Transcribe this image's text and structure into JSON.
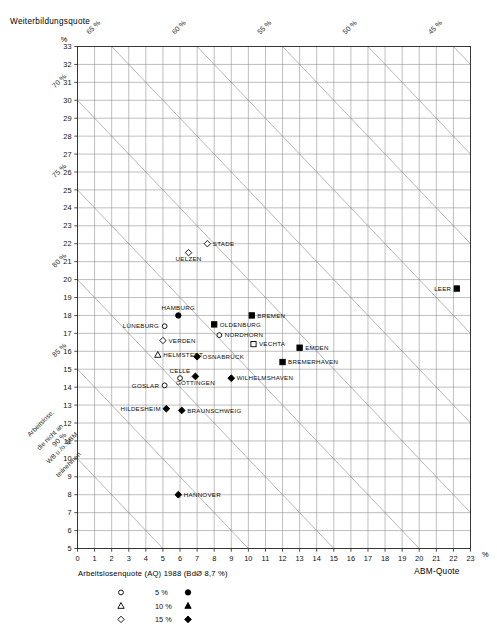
{
  "meta": {
    "y_axis_title": "Weiterbildungsquote",
    "y_axis_unit": "%",
    "x_axis_title": "ABM-Quote",
    "x_axis_unit": "%",
    "rotated_note": "Arbeitslose, die nicht an ABM u./o. WB teilnehmen",
    "legend_title": "Arbeitslosenquote (AQ) 1988 (BdØ 8,7 %)",
    "colors": {
      "grid": "#8a8a8a",
      "grid_minor": "#b9b9b9",
      "axis": "#222222",
      "diagonal": "#9a9a9a",
      "marker": "#000000",
      "background": "#ffffff"
    }
  },
  "legend": {
    "rows": [
      {
        "open_symbol": "circle",
        "label": "5 %",
        "filled_symbol": "circle"
      },
      {
        "open_symbol": "triangle",
        "label": "10 %",
        "filled_symbol": "triangle"
      },
      {
        "open_symbol": "diamond",
        "label": "15 %",
        "filled_symbol": "diamond"
      }
    ]
  },
  "chart_data": {
    "type": "scatter",
    "xlabel": "ABM-Quote",
    "ylabel": "Weiterbildungsquote",
    "xunit": "%",
    "yunit": "%",
    "xlim": [
      0,
      23
    ],
    "ylim": [
      5,
      33
    ],
    "xticks": [
      0,
      1,
      2,
      3,
      4,
      5,
      6,
      7,
      8,
      9,
      10,
      11,
      12,
      13,
      14,
      15,
      16,
      17,
      18,
      19,
      20,
      21,
      22,
      23
    ],
    "yticks": [
      5,
      6,
      7,
      8,
      9,
      10,
      11,
      12,
      13,
      14,
      15,
      16,
      17,
      18,
      19,
      20,
      21,
      22,
      23,
      24,
      25,
      26,
      27,
      28,
      29,
      30,
      31,
      32,
      33
    ],
    "grid": true,
    "legend_position": "bottom",
    "diagonals": {
      "note": "Lines of constant share of unemployed not in ABM or WB; x + y = 100 - value",
      "labels": [
        "70 %",
        "75 %",
        "80 %",
        "85 %",
        "90 %",
        "65 %",
        "60 %",
        "55 %",
        "50 %",
        "45 %"
      ],
      "values": [
        70,
        75,
        80,
        85,
        90,
        65,
        60,
        55,
        50,
        45
      ]
    },
    "points": [
      {
        "name": "STADE",
        "x": 7.6,
        "y": 22.0,
        "symbol": "diamond",
        "fill": "open",
        "label_side": "right"
      },
      {
        "name": "UELZEN",
        "x": 6.5,
        "y": 21.5,
        "symbol": "diamond",
        "fill": "open",
        "label_side": "below"
      },
      {
        "name": "LEER",
        "x": 22.2,
        "y": 19.5,
        "symbol": "square",
        "fill": "filled",
        "label_side": "left"
      },
      {
        "name": "HAMBURG",
        "x": 5.9,
        "y": 18.0,
        "symbol": "circle",
        "fill": "filled",
        "label_side": "above"
      },
      {
        "name": "BREMEN",
        "x": 10.2,
        "y": 18.0,
        "symbol": "square",
        "fill": "filled",
        "label_side": "right"
      },
      {
        "name": "OLDENBURG",
        "x": 8.0,
        "y": 17.5,
        "symbol": "square",
        "fill": "filled",
        "label_side": "right"
      },
      {
        "name": "LÜNEBURG",
        "x": 5.1,
        "y": 17.4,
        "symbol": "circle",
        "fill": "open",
        "label_side": "left"
      },
      {
        "name": "NORDHORN",
        "x": 8.3,
        "y": 16.9,
        "symbol": "circle",
        "fill": "open",
        "label_side": "right"
      },
      {
        "name": "VERDEN",
        "x": 5.0,
        "y": 16.6,
        "symbol": "diamond",
        "fill": "open",
        "label_side": "right"
      },
      {
        "name": "VECHTA",
        "x": 10.3,
        "y": 16.4,
        "symbol": "square",
        "fill": "open",
        "label_side": "right"
      },
      {
        "name": "EMDEN",
        "x": 13.0,
        "y": 16.2,
        "symbol": "square",
        "fill": "filled",
        "label_side": "right"
      },
      {
        "name": "HELMSTEDT",
        "x": 4.7,
        "y": 15.8,
        "symbol": "triangle",
        "fill": "open",
        "label_side": "right"
      },
      {
        "name": "OSNABRÜCK",
        "x": 7.0,
        "y": 15.7,
        "symbol": "diamond",
        "fill": "filled",
        "label_side": "right"
      },
      {
        "name": "BREMERHAVEN",
        "x": 12.0,
        "y": 15.4,
        "symbol": "square",
        "fill": "filled",
        "label_side": "right"
      },
      {
        "name": "CELLE",
        "x": 6.0,
        "y": 14.5,
        "symbol": "circle",
        "fill": "open",
        "label_side": "above"
      },
      {
        "name": "GÖTTINGEN",
        "x": 6.9,
        "y": 14.6,
        "symbol": "diamond",
        "fill": "filled",
        "label_side": "below"
      },
      {
        "name": "WILHELMSHAVEN",
        "x": 9.0,
        "y": 14.5,
        "symbol": "diamond",
        "fill": "filled",
        "label_side": "right"
      },
      {
        "name": "GOSLAR",
        "x": 5.1,
        "y": 14.1,
        "symbol": "circle",
        "fill": "open",
        "label_side": "left"
      },
      {
        "name": "HILDESHEIM",
        "x": 5.2,
        "y": 12.8,
        "symbol": "diamond",
        "fill": "filled",
        "label_side": "left"
      },
      {
        "name": "BRAUNSCHWEIG",
        "x": 6.1,
        "y": 12.7,
        "symbol": "diamond",
        "fill": "filled",
        "label_side": "right"
      },
      {
        "name": "HANNOVER",
        "x": 5.9,
        "y": 8.0,
        "symbol": "diamond",
        "fill": "filled",
        "label_side": "right"
      }
    ]
  }
}
